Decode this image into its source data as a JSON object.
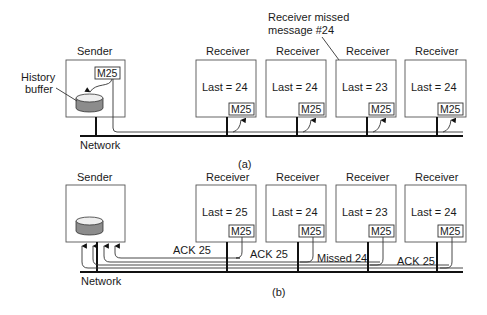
{
  "panel_a": {
    "caption": "(a)",
    "sender": {
      "title": "Sender",
      "message": "M25",
      "history_label_line1": "History",
      "history_label_line2": "buffer"
    },
    "network_label": "Network",
    "annotation_line1": "Receiver missed",
    "annotation_line2": "message #24",
    "receivers": [
      {
        "title": "Receiver",
        "last": "Last = 24",
        "message": "M25"
      },
      {
        "title": "Receiver",
        "last": "Last = 24",
        "message": "M25"
      },
      {
        "title": "Receiver",
        "last": "Last = 23",
        "message": "M25"
      },
      {
        "title": "Receiver",
        "last": "Last = 24",
        "message": "M25"
      }
    ]
  },
  "panel_b": {
    "caption": "(b)",
    "sender": {
      "title": "Sender"
    },
    "network_label": "Network",
    "receivers": [
      {
        "title": "Receiver",
        "last": "Last = 25",
        "message": "M25",
        "reply": "ACK 25"
      },
      {
        "title": "Receiver",
        "last": "Last = 24",
        "message": "M25",
        "reply": "ACK 25"
      },
      {
        "title": "Receiver",
        "last": "Last = 23",
        "message": "M25",
        "reply": "Missed 24"
      },
      {
        "title": "Receiver",
        "last": "Last = 24",
        "message": "M25",
        "reply": "ACK 25"
      }
    ]
  },
  "colors": {
    "line": "#111111",
    "box_stroke": "#555555",
    "cylinder_fill": "#8c8c8c",
    "cylinder_top": "#e8e8e8"
  }
}
